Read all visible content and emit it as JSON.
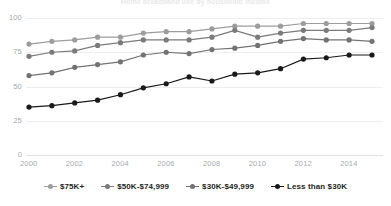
{
  "chart_data": {
    "type": "line",
    "title": "Home broadband use by household income",
    "xlabel": "",
    "ylabel": "",
    "ylim": [
      0,
      100
    ],
    "xlim": [
      2000,
      2015
    ],
    "yticks": [
      0,
      25,
      50,
      75,
      100
    ],
    "xticks": [
      2000,
      2002,
      2004,
      2006,
      2008,
      2010,
      2012,
      2014
    ],
    "grid": true,
    "legend_position": "bottom",
    "x": [
      2000,
      2001,
      2002,
      2003,
      2004,
      2005,
      2006,
      2007,
      2008,
      2009,
      2010,
      2011,
      2012,
      2013,
      2014,
      2015
    ],
    "series": [
      {
        "name": "$75K+",
        "color": "#9d9d9d",
        "values": [
          81,
          83,
          84,
          86,
          86,
          89,
          90,
          90,
          92,
          94,
          94,
          94,
          96,
          96,
          96,
          96
        ]
      },
      {
        "name": "$50K-$74,999",
        "color": "#7b7b7b",
        "values": [
          72,
          75,
          76,
          80,
          82,
          84,
          84,
          84,
          86,
          91,
          86,
          89,
          91,
          91,
          91,
          93
        ]
      },
      {
        "name": "$30K-$49,999",
        "color": "#737373",
        "values": [
          58,
          60,
          64,
          66,
          68,
          73,
          75,
          74,
          77,
          78,
          80,
          83,
          85,
          84,
          84,
          83
        ]
      },
      {
        "name": "Less than $30K",
        "color": "#1a1a1a",
        "values": [
          35,
          36,
          38,
          40,
          44,
          49,
          52,
          57,
          54,
          59,
          60,
          63,
          70,
          71,
          73,
          73
        ]
      }
    ]
  },
  "axis": {
    "y_labels": [
      "100",
      "75",
      "50",
      "25",
      "0"
    ],
    "x_labels": [
      "2000",
      "2002",
      "2004",
      "2006",
      "2008",
      "2010",
      "2012",
      "2014"
    ]
  },
  "legend": {
    "items": [
      {
        "label": "$75K+"
      },
      {
        "label": "$50K-$74,999"
      },
      {
        "label": "$30K-$49,999"
      },
      {
        "label": "Less than $30K"
      }
    ]
  }
}
